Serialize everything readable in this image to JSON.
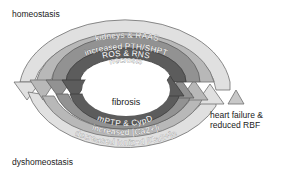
{
  "labels": {
    "top_left": "homeostasis",
    "bottom_left": "dyshomeostasis",
    "right": [
      "heart failure &",
      "reduced RBF"
    ],
    "center": "fibrosis"
  },
  "rings": [
    {
      "level": 1,
      "top": "kidneys & RAAS",
      "bottom": "decreased ionized [Ca2+]e",
      "color": "#dcdcdc"
    },
    {
      "level": 2,
      "top": "increased PTH/SHPT",
      "bottom": "increased [Ca2+]i",
      "color": "#b4b4b4"
    },
    {
      "level": 3,
      "top": "ROS & RNS",
      "bottom": "",
      "color": "#8e8e8e"
    },
    {
      "level": 4,
      "top": "necrosis",
      "bottom": "mPTP & CypD",
      "color": "#5a5a5a"
    }
  ],
  "colors": {
    "outline": "#6e6e6e",
    "small_arrow": "#c8c8c8"
  }
}
